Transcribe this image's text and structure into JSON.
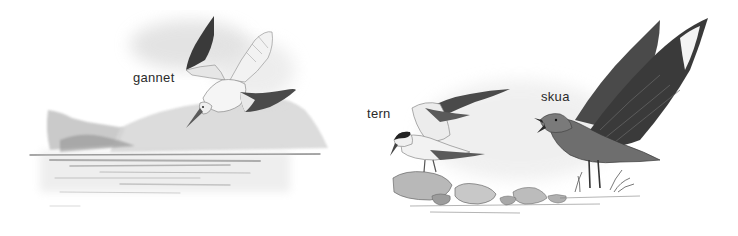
{
  "illustration": {
    "description": "Grayscale pencil and watercolor illustration of three seabirds",
    "labels": {
      "gannet": "gannet",
      "tern": "tern",
      "skua": "skua"
    },
    "palette": {
      "background": "#ffffff",
      "ink": "#2a2a2a",
      "dark_wing": "#3a3a3a",
      "mid_gray": "#8a8a8a",
      "light_gray": "#d4d4d4",
      "wash": "#e8e8e8"
    }
  }
}
